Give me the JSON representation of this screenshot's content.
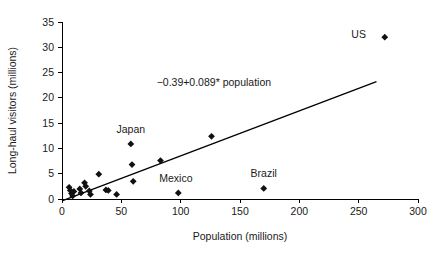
{
  "chart_data": {
    "type": "scatter",
    "title": "",
    "xlabel": "Population (millions)",
    "ylabel": "Long-haul visitors (millions)",
    "xlim": [
      0,
      300
    ],
    "ylim": [
      0,
      35
    ],
    "xticks": [
      0,
      50,
      100,
      150,
      200,
      250,
      300
    ],
    "yticks": [
      0,
      5,
      10,
      15,
      20,
      25,
      30,
      35
    ],
    "grid": false,
    "legend": null,
    "annotation": "−0.39+0.089* population",
    "fit_line": {
      "intercept": -0.39,
      "slope": 0.089,
      "x_start": 0,
      "x_end": 265
    },
    "points": [
      {
        "x": 6,
        "y": 2.3,
        "label": ""
      },
      {
        "x": 7,
        "y": 1.7,
        "label": ""
      },
      {
        "x": 8,
        "y": 1.1,
        "label": ""
      },
      {
        "x": 9,
        "y": 0.6,
        "label": ""
      },
      {
        "x": 10,
        "y": 1.5,
        "label": ""
      },
      {
        "x": 15,
        "y": 2.0,
        "label": ""
      },
      {
        "x": 16,
        "y": 1.2,
        "label": ""
      },
      {
        "x": 19,
        "y": 3.2,
        "label": ""
      },
      {
        "x": 20,
        "y": 2.5,
        "label": ""
      },
      {
        "x": 23,
        "y": 1.6,
        "label": ""
      },
      {
        "x": 24,
        "y": 0.9,
        "label": ""
      },
      {
        "x": 31,
        "y": 4.9,
        "label": ""
      },
      {
        "x": 37,
        "y": 1.8,
        "label": ""
      },
      {
        "x": 39,
        "y": 1.7,
        "label": ""
      },
      {
        "x": 46,
        "y": 0.9,
        "label": ""
      },
      {
        "x": 58,
        "y": 10.9,
        "label": "Japan"
      },
      {
        "x": 59,
        "y": 6.8,
        "label": ""
      },
      {
        "x": 60,
        "y": 3.5,
        "label": ""
      },
      {
        "x": 83,
        "y": 7.6,
        "label": ""
      },
      {
        "x": 98,
        "y": 1.2,
        "label": "Mexico"
      },
      {
        "x": 126,
        "y": 12.4,
        "label": ""
      },
      {
        "x": 170,
        "y": 2.1,
        "label": "Brazil"
      },
      {
        "x": 272,
        "y": 32.0,
        "label": "US"
      }
    ],
    "point_labels": [
      {
        "text": "Japan",
        "x": 58,
        "y": 10.9,
        "dx": 0,
        "dy": 2.9
      },
      {
        "text": "Mexico",
        "x": 98,
        "y": 1.2,
        "dx": -2,
        "dy": 2.9
      },
      {
        "text": "Brazil",
        "x": 170,
        "y": 2.1,
        "dx": 0,
        "dy": 2.9
      },
      {
        "text": "US",
        "x": 272,
        "y": 32.0,
        "dx": -22,
        "dy": 0.45
      }
    ],
    "annotation_pos": {
      "x": 128,
      "y": 22.4
    },
    "colors": {
      "marker": "#111111",
      "line": "#000000",
      "axis": "#000000",
      "text": "#1a1a1a",
      "background": "#ffffff"
    }
  }
}
